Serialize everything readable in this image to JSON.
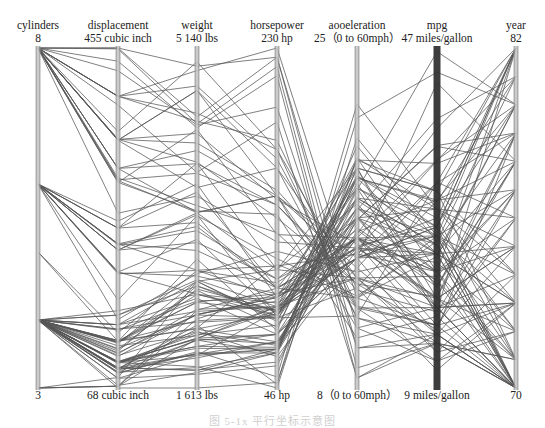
{
  "chart_data": {
    "type": "parallel_coordinates",
    "title": "",
    "caption": "图 5-1x  平行坐标示意图",
    "line_color": "#555555",
    "axis_color": "#999999",
    "highlight_axis": "mpg",
    "highlight_axis_color": "#333333",
    "axes": [
      {
        "key": "cylinders",
        "label": "cylinders",
        "max": 8,
        "min": 3,
        "max_label": "8",
        "min_label": "3"
      },
      {
        "key": "displacement",
        "label": "displacement",
        "max": 455,
        "min": 68,
        "max_label": "455 cubic inch",
        "min_label": "68 cubic inch"
      },
      {
        "key": "weight",
        "label": "weight",
        "max": 5140,
        "min": 1613,
        "max_label": "5 140 lbs",
        "min_label": "1 613 lbs"
      },
      {
        "key": "horsepower",
        "label": "horsepower",
        "max": 230,
        "min": 46,
        "max_label": "230 hp",
        "min_label": "46 hp"
      },
      {
        "key": "acceleration",
        "label": "aooeleration",
        "max": 25,
        "min": 8,
        "max_label": "25（0 to 60mph）",
        "min_label": "8（0 to 60mph）"
      },
      {
        "key": "mpg",
        "label": "mpg",
        "max": 47,
        "min": 9,
        "max_label": "47 miles/gallon",
        "min_label": "9 miles/gallon"
      },
      {
        "key": "year",
        "label": "year",
        "max": 82,
        "min": 70,
        "max_label": "82",
        "min_label": "70"
      }
    ],
    "records": [
      [
        8,
        307,
        3504,
        130,
        12,
        18,
        70
      ],
      [
        8,
        350,
        3693,
        165,
        11.5,
        15,
        70
      ],
      [
        8,
        318,
        3436,
        150,
        11,
        18,
        70
      ],
      [
        8,
        304,
        3433,
        150,
        12,
        16,
        70
      ],
      [
        8,
        302,
        3449,
        140,
        10.5,
        17,
        70
      ],
      [
        8,
        429,
        4341,
        198,
        10,
        15,
        70
      ],
      [
        8,
        454,
        4354,
        220,
        9,
        14,
        70
      ],
      [
        8,
        440,
        4312,
        215,
        8.5,
        14,
        70
      ],
      [
        8,
        455,
        4425,
        225,
        10,
        14,
        70
      ],
      [
        8,
        390,
        3850,
        190,
        8.5,
        15,
        70
      ],
      [
        4,
        113,
        2372,
        95,
        15,
        24,
        70
      ],
      [
        6,
        198,
        2833,
        95,
        15.5,
        22,
        70
      ],
      [
        6,
        199,
        2774,
        97,
        15.5,
        18,
        70
      ],
      [
        6,
        200,
        2587,
        85,
        16,
        21,
        70
      ],
      [
        4,
        97,
        2130,
        88,
        14.5,
        27,
        70
      ],
      [
        4,
        97,
        1835,
        46,
        20.5,
        26,
        70
      ],
      [
        4,
        110,
        2672,
        87,
        17.5,
        25,
        70
      ],
      [
        4,
        107,
        2430,
        90,
        14.5,
        24,
        70
      ],
      [
        4,
        104,
        2375,
        95,
        17.5,
        25,
        70
      ],
      [
        4,
        121,
        2234,
        113,
        12.5,
        26,
        70
      ],
      [
        6,
        250,
        3329,
        100,
        15.5,
        21,
        71
      ],
      [
        8,
        400,
        4464,
        175,
        11.5,
        14,
        71
      ],
      [
        8,
        351,
        4154,
        153,
        13.5,
        14,
        71
      ],
      [
        4,
        140,
        2408,
        90,
        19.5,
        22,
        71
      ],
      [
        4,
        98,
        2164,
        80,
        15,
        28,
        71
      ],
      [
        6,
        232,
        3288,
        100,
        15.5,
        19,
        71
      ],
      [
        4,
        122,
        2226,
        86,
        16.5,
        25,
        71
      ],
      [
        4,
        71,
        1773,
        65,
        19,
        31,
        71
      ],
      [
        4,
        97,
        1950,
        88,
        14.5,
        27,
        72
      ],
      [
        8,
        350,
        4699,
        165,
        13.5,
        13,
        72
      ],
      [
        3,
        70,
        2330,
        97,
        13.5,
        19,
        72
      ],
      [
        4,
        120,
        2506,
        97,
        15,
        23,
        72
      ],
      [
        8,
        400,
        4746,
        170,
        12,
        12,
        72
      ],
      [
        4,
        96,
        2189,
        69,
        18,
        26,
        72
      ],
      [
        8,
        455,
        4951,
        225,
        11,
        12,
        73
      ],
      [
        8,
        318,
        4077,
        150,
        14,
        15,
        73
      ],
      [
        6,
        225,
        3121,
        105,
        16.5,
        18,
        73
      ],
      [
        4,
        90,
        2108,
        75,
        15.5,
        26,
        73
      ],
      [
        4,
        122,
        2310,
        85,
        18.5,
        24,
        73
      ],
      [
        3,
        70,
        2124,
        90,
        13.5,
        18,
        73
      ],
      [
        8,
        360,
        4997,
        175,
        13,
        11,
        73
      ],
      [
        8,
        400,
        4906,
        230,
        12.5,
        16,
        73
      ],
      [
        4,
        116,
        2158,
        90,
        15.5,
        24,
        73
      ],
      [
        6,
        250,
        3645,
        100,
        18,
        18,
        74
      ],
      [
        4,
        79,
        1950,
        67,
        19,
        31,
        74
      ],
      [
        4,
        91,
        1795,
        67,
        17.5,
        29,
        74
      ],
      [
        4,
        140,
        2542,
        75,
        17,
        26,
        74
      ],
      [
        8,
        350,
        4699,
        150,
        14.5,
        13,
        74
      ],
      [
        6,
        232,
        3039,
        100,
        15,
        19,
        75
      ],
      [
        8,
        351,
        4254,
        148,
        15.2,
        15,
        75
      ],
      [
        4,
        120,
        2582,
        88,
        17,
        24,
        75
      ],
      [
        6,
        258,
        3730,
        95,
        19,
        19,
        75
      ],
      [
        4,
        90,
        2223,
        71,
        16.5,
        29,
        75
      ],
      [
        4,
        108,
        2379,
        93,
        16.5,
        22,
        75
      ],
      [
        8,
        302,
        4295,
        129,
        15.5,
        16,
        76
      ],
      [
        4,
        85,
        1990,
        52,
        22.2,
        29,
        76
      ],
      [
        6,
        250,
        3945,
        110,
        19,
        17,
        76
      ],
      [
        4,
        97,
        2045,
        75,
        14.5,
        32,
        76
      ],
      [
        4,
        140,
        2720,
        83,
        17,
        22,
        76
      ],
      [
        3,
        80,
        2720,
        110,
        13.5,
        21.5,
        77
      ],
      [
        8,
        400,
        4380,
        180,
        12.1,
        16,
        77
      ],
      [
        4,
        89,
        1965,
        71,
        15.8,
        30,
        77
      ],
      [
        6,
        231,
        3245,
        105,
        15.5,
        22,
        77
      ],
      [
        4,
        134,
        2515,
        95,
        14.8,
        26,
        77
      ],
      [
        8,
        305,
        3840,
        145,
        12.9,
        17.5,
        77
      ],
      [
        4,
        98,
        2045,
        68,
        18.5,
        30,
        78
      ],
      [
        6,
        225,
        3430,
        110,
        17.2,
        20.5,
        78
      ],
      [
        4,
        151,
        2671,
        85,
        17.4,
        24,
        78
      ],
      [
        4,
        86,
        1825,
        65,
        16.4,
        36,
        78
      ],
      [
        8,
        318,
        3940,
        145,
        13.2,
        19.2,
        78
      ],
      [
        5,
        131,
        2830,
        103,
        15.9,
        20.3,
        78
      ],
      [
        4,
        97,
        2130,
        75,
        14.5,
        43.1,
        78
      ],
      [
        8,
        351,
        3955,
        138,
        13.2,
        15.5,
        79
      ],
      [
        4,
        89,
        1925,
        71,
        14,
        31.9,
        79
      ],
      [
        6,
        200,
        3155,
        85,
        18.2,
        20.2,
        79
      ],
      [
        5,
        121,
        2950,
        77,
        20.1,
        25.4,
        79
      ],
      [
        4,
        85,
        1975,
        65,
        19.4,
        34.1,
        79
      ],
      [
        8,
        267,
        3605,
        125,
        15,
        19.2,
        79
      ],
      [
        4,
        91,
        1800,
        60,
        16.4,
        36.1,
        79
      ],
      [
        4,
        98,
        2120,
        70,
        15.5,
        34.5,
        80
      ],
      [
        4,
        90,
        2265,
        48,
        21.5,
        44.3,
        80
      ],
      [
        4,
        86,
        2110,
        65,
        17.9,
        46.6,
        80
      ],
      [
        6,
        146,
        2800,
        120,
        13.8,
        24,
        80
      ],
      [
        4,
        122,
        2500,
        88,
        15.1,
        27.2,
        80
      ],
      [
        4,
        135,
        2370,
        84,
        13,
        30,
        80
      ],
      [
        3,
        70,
        2420,
        100,
        12.5,
        23.7,
        80
      ],
      [
        4,
        97,
        2025,
        67,
        18.5,
        29.8,
        81
      ],
      [
        4,
        105,
        2200,
        63,
        14.9,
        34.4,
        81
      ],
      [
        6,
        168,
        3400,
        116,
        12.6,
        25.4,
        81
      ],
      [
        4,
        79,
        1755,
        58,
        16.9,
        39.1,
        81
      ],
      [
        6,
        225,
        3410,
        85,
        16.6,
        17.6,
        82
      ],
      [
        4,
        112,
        2640,
        88,
        18.6,
        27,
        82
      ],
      [
        4,
        91,
        1965,
        67,
        15.7,
        38,
        82
      ],
      [
        4,
        151,
        2735,
        90,
        18,
        27,
        82
      ],
      [
        6,
        232,
        2835,
        112,
        14.7,
        22,
        82
      ],
      [
        4,
        135,
        2295,
        84,
        11.6,
        32,
        82
      ],
      [
        4,
        120,
        2625,
        79,
        18.6,
        28,
        82
      ],
      [
        4,
        119,
        2720,
        82,
        19.4,
        31,
        82
      ],
      [
        4,
        68,
        1613,
        49,
        19.5,
        29,
        73
      ],
      [
        4,
        156,
        2585,
        92,
        14.5,
        26,
        82
      ]
    ]
  }
}
